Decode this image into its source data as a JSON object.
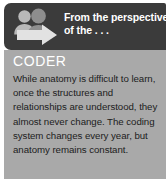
{
  "callout": {
    "header": {
      "icon_name": "people-with-arrow-icon",
      "line_1": "From the perspective",
      "line_2": "of the . . .",
      "background_color": "#3b3b3b",
      "text_color": "#ffffff"
    },
    "body": {
      "role_heading": "CODER",
      "paragraph": "While anatomy is difficult to learn, once the structures and relationships are understood, they almost never change. The coding system changes every year, but anatomy remains constant.",
      "background_color": "#a9a9a9",
      "heading_color": "#ffffff",
      "text_color": "#1c1c1c"
    }
  }
}
